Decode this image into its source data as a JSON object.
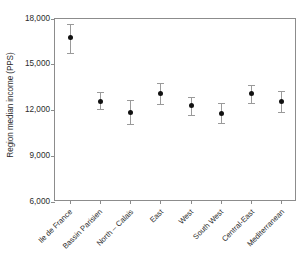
{
  "chart_data": {
    "type": "scatter",
    "title": "",
    "subtitle": "",
    "xlabel": "",
    "ylabel": "Region median income (PPS)",
    "categories": [
      "Ile de France",
      "Bassin Parisien",
      "North – Calais",
      "East",
      "West",
      "South West",
      "Central-East",
      "Mediterranean"
    ],
    "values": [
      16800,
      12600,
      11900,
      13100,
      12300,
      11800,
      13100,
      12600
    ],
    "error_low": [
      15800,
      12100,
      11100,
      12400,
      11700,
      11200,
      12500,
      11900
    ],
    "error_high": [
      17700,
      13200,
      12700,
      13800,
      12900,
      12500,
      13700,
      13300
    ],
    "ylim": [
      6000,
      18000
    ],
    "yticks": [
      6000,
      9000,
      12000,
      15000,
      18000
    ],
    "ytick_labels": [
      "6,000",
      "9,000",
      "12,000",
      "15,000",
      "18,000"
    ],
    "grid": false,
    "legend": false,
    "marker_color": "#111111",
    "errorbar_color": "#9a9a9a",
    "axis_color": "#8c8c8c",
    "background_color": "#ffffff"
  }
}
